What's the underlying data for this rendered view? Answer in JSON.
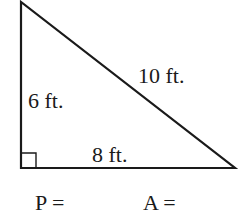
{
  "diagram": {
    "type": "right-triangle",
    "sides": {
      "hypotenuse": "10 ft.",
      "vertical_leg": "6 ft.",
      "base": "8 ft."
    },
    "right_angle_marker": true,
    "prompts": {
      "perimeter": "P =",
      "area": "A ="
    },
    "colors": {
      "stroke": "#1a1a1a",
      "background": "#ffffff"
    }
  }
}
